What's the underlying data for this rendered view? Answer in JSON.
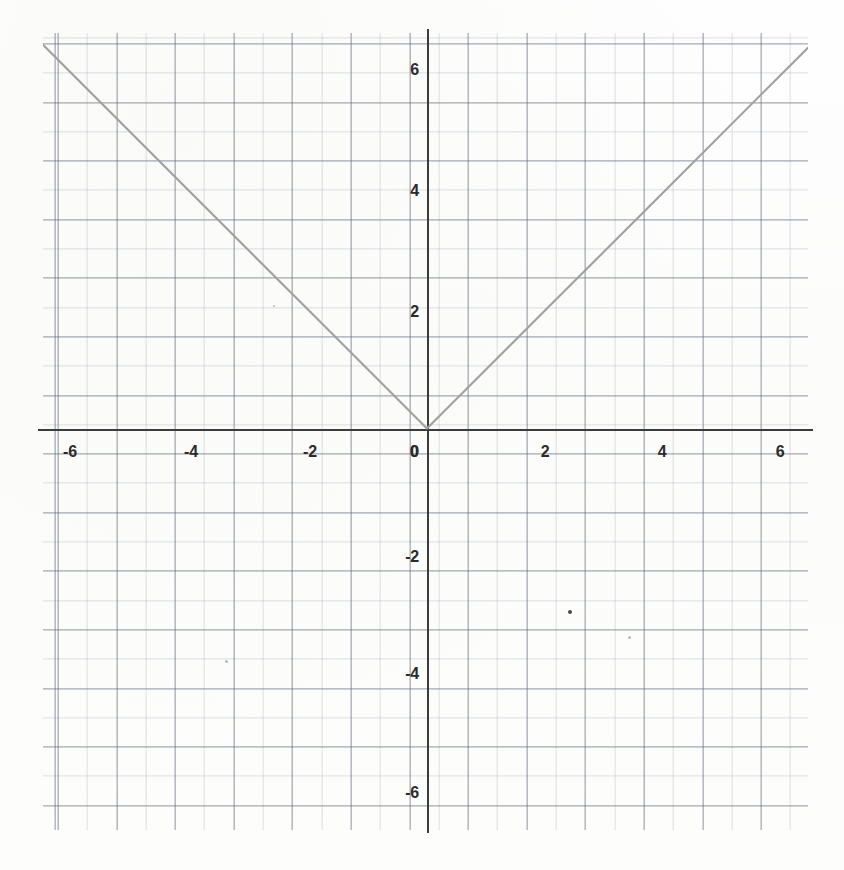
{
  "chart_data": {
    "type": "line",
    "title": "",
    "subtitle": "",
    "xlabel": "",
    "ylabel": "",
    "function": "y = |x|",
    "grid": true,
    "grid_major_step": 1,
    "grid_minor_step": 0.5,
    "legend": "none",
    "xlim": [
      -6.55,
      6.5
    ],
    "ylim": [
      -6.85,
      6.75
    ],
    "x_ticks": [
      -6,
      -4,
      -2,
      0,
      2,
      4,
      6
    ],
    "y_ticks": [
      6,
      4,
      2,
      0,
      -2,
      -4,
      -6
    ],
    "x_tick_labels": [
      "-6",
      "-4",
      "-2",
      "0",
      "2",
      "4",
      "6"
    ],
    "y_tick_labels": [
      "6",
      "4",
      "2",
      "0",
      "-2",
      "-4",
      "-6"
    ],
    "series": [
      {
        "name": "y = |x|",
        "color": "#a0a0a0",
        "points": [
          {
            "x": -6.55,
            "y": 6.55
          },
          {
            "x": -6,
            "y": 6
          },
          {
            "x": -4,
            "y": 4
          },
          {
            "x": -2,
            "y": 2
          },
          {
            "x": 0,
            "y": 0
          },
          {
            "x": 2,
            "y": 2
          },
          {
            "x": 4,
            "y": 4
          },
          {
            "x": 6,
            "y": 6
          },
          {
            "x": 6.5,
            "y": 6.5
          }
        ]
      }
    ],
    "annotations": [],
    "vertex": {
      "x": 0,
      "y": 0
    }
  },
  "colors": {
    "background": "#fdfdfc",
    "axis": "#3b3b3b",
    "grid_major": "#5a6473",
    "grid_minor": "#8c96a5",
    "curve": "#a0a0a0",
    "tick_label": "#2b2b2b"
  },
  "axis_labels": {
    "x": [
      {
        "value": "-6",
        "px": 70
      },
      {
        "value": "-4",
        "px": 191
      },
      {
        "value": "-2",
        "px": 310
      },
      {
        "value": "0",
        "px": 414
      },
      {
        "value": "2",
        "px": 545
      },
      {
        "value": "4",
        "px": 662
      },
      {
        "value": "6",
        "px": 780
      }
    ],
    "y": [
      {
        "value": "6",
        "px": 70
      },
      {
        "value": "4",
        "px": 191
      },
      {
        "value": "2",
        "px": 312
      },
      {
        "value": "0",
        "px": 452
      },
      {
        "value": "-2",
        "px": 557
      },
      {
        "value": "-4",
        "px": 674
      },
      {
        "value": "-6",
        "px": 793
      }
    ]
  }
}
